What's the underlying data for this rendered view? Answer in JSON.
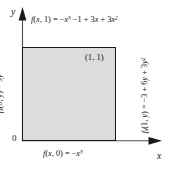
{
  "figure": {
    "axes": {
      "x_label": "x",
      "y_label": "y",
      "origin_label": "0"
    },
    "region": {
      "corner_point_label": "(1, 1)",
      "fill_color": "#dcdcdc",
      "border_color": "#1a1a1a",
      "x_range": [
        0,
        1
      ],
      "y_range": [
        0,
        1
      ]
    },
    "boundary_labels": {
      "top": {
        "lhs": "f(x, 1)",
        "rhs": "= −x³ −1 + 3x + 3x²",
        "full": "f(x, 1) = −x³ − 1 + 3x + 3x²",
        "position": "top"
      },
      "bottom": {
        "lhs": "f(x, 0)",
        "rhs": "= −x³",
        "full": "f(x, 0) = −x³",
        "position": "bottom"
      },
      "left": {
        "lhs": "fₓ(0, y)",
        "rhs": "= 3y²",
        "full": "fₓ(0, y) = 3y²",
        "position": "left-rotated"
      },
      "right": {
        "lhs": "fₓ(1, y)",
        "rhs": "= −3 + 6y + 3y²",
        "full": "fₓ(1, y) = −3 + 6y + 3y²",
        "position": "right-rotated"
      }
    }
  }
}
